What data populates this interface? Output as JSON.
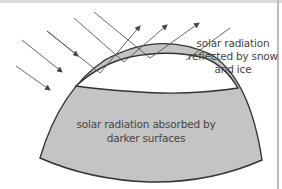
{
  "diagram": {
    "labels": {
      "reflected": "solar radiation reflected by snow and ice",
      "absorbed": "solar radiation absorbed by darker surfaces"
    },
    "regions": [
      {
        "name": "snow-and-ice",
        "color": "#ffffff"
      },
      {
        "name": "darker-surface",
        "color": "#c4c4c4"
      }
    ],
    "colors": {
      "outline": "#333333",
      "ray": "#555555",
      "text": "#444444"
    },
    "incoming_rays_absorbed": 3,
    "incoming_rays_reflected": 3,
    "reflected_rays": 3
  }
}
